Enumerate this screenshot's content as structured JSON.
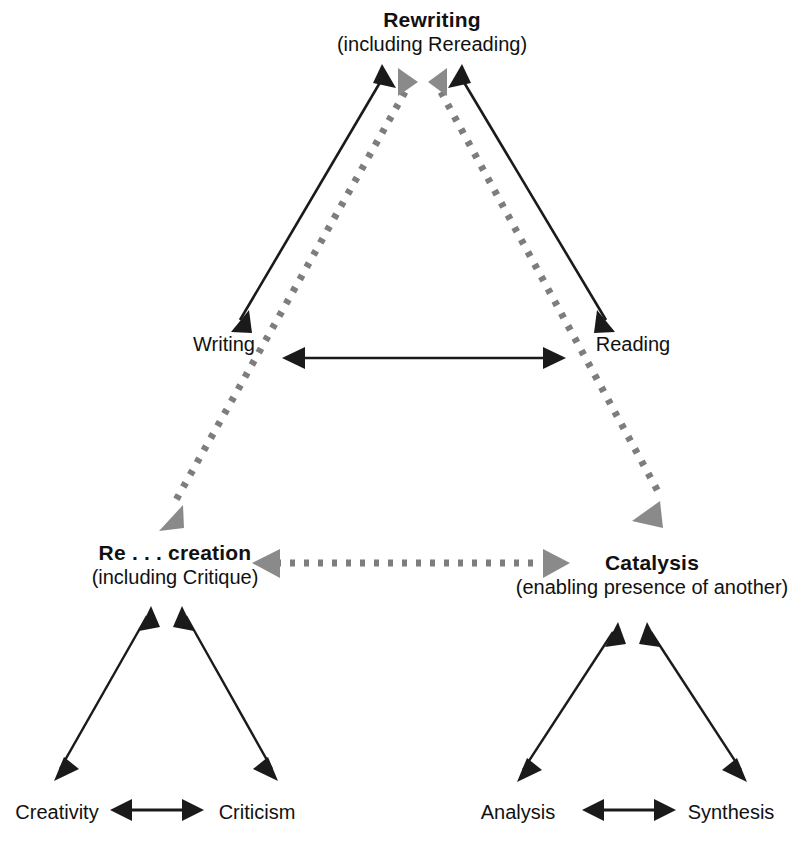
{
  "diagram": {
    "colors": {
      "solid_edge": "#1a1a1a",
      "dotted_edge": "#7d7d7d",
      "text": "#111111",
      "background": "#ffffff"
    },
    "nodes": {
      "rewriting": {
        "label": "Rewriting",
        "sub": "(including Rereading)"
      },
      "writing": {
        "label": "Writing",
        "sub": ""
      },
      "reading": {
        "label": "Reading",
        "sub": ""
      },
      "recreation": {
        "label": "Re . . . creation",
        "sub": "(including Critique)"
      },
      "catalysis": {
        "label": "Catalysis",
        "sub": "(enabling presence of another)"
      },
      "creativity": {
        "label": "Creativity",
        "sub": ""
      },
      "criticism": {
        "label": "Criticism",
        "sub": ""
      },
      "analysis": {
        "label": "Analysis",
        "sub": ""
      },
      "synthesis": {
        "label": "Synthesis",
        "sub": ""
      }
    },
    "edges": [
      {
        "id": "rewriting-writing",
        "from": "rewriting",
        "to": "writing",
        "style": "solid",
        "heads": "both"
      },
      {
        "id": "rewriting-reading",
        "from": "rewriting",
        "to": "reading",
        "style": "solid",
        "heads": "both"
      },
      {
        "id": "writing-reading",
        "from": "writing",
        "to": "reading",
        "style": "solid",
        "heads": "both"
      },
      {
        "id": "rewriting-recreation",
        "from": "rewriting",
        "to": "recreation",
        "style": "dotted",
        "heads": "both"
      },
      {
        "id": "rewriting-catalysis",
        "from": "rewriting",
        "to": "catalysis",
        "style": "dotted",
        "heads": "both"
      },
      {
        "id": "recreation-catalysis",
        "from": "recreation",
        "to": "catalysis",
        "style": "dotted",
        "heads": "both"
      },
      {
        "id": "recreation-creativity",
        "from": "recreation",
        "to": "creativity",
        "style": "solid",
        "heads": "both"
      },
      {
        "id": "recreation-criticism",
        "from": "recreation",
        "to": "criticism",
        "style": "solid",
        "heads": "both"
      },
      {
        "id": "creativity-criticism",
        "from": "creativity",
        "to": "criticism",
        "style": "solid",
        "heads": "both"
      },
      {
        "id": "catalysis-analysis",
        "from": "catalysis",
        "to": "analysis",
        "style": "solid",
        "heads": "both"
      },
      {
        "id": "catalysis-synthesis",
        "from": "catalysis",
        "to": "synthesis",
        "style": "solid",
        "heads": "both"
      },
      {
        "id": "analysis-synthesis",
        "from": "analysis",
        "to": "synthesis",
        "style": "solid",
        "heads": "both"
      }
    ]
  }
}
